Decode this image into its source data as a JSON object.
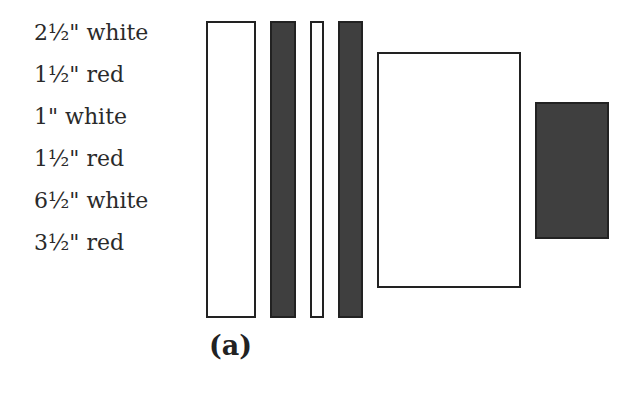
{
  "labels": [
    {
      "text": "2½\" white",
      "top": 0
    },
    {
      "text": "1½\" red",
      "top": 42
    },
    {
      "text": "1\" white",
      "top": 84
    },
    {
      "text": "1½\" red",
      "top": 126
    },
    {
      "text": "6½\" white",
      "top": 168
    },
    {
      "text": "3½\" red",
      "top": 210
    }
  ],
  "pieces": [
    {
      "name": "strip-2-5-white",
      "color": "white",
      "x": 206,
      "y": 21,
      "w": 50,
      "h": 297
    },
    {
      "name": "strip-1-5-red",
      "color": "red",
      "x": 270,
      "y": 21,
      "w": 26,
      "h": 297
    },
    {
      "name": "strip-1-white",
      "color": "white",
      "x": 310,
      "y": 21,
      "w": 14,
      "h": 297
    },
    {
      "name": "strip-1-5-red-2",
      "color": "red",
      "x": 338,
      "y": 21,
      "w": 25,
      "h": 297
    },
    {
      "name": "square-6-5-white",
      "color": "white",
      "x": 377,
      "y": 52,
      "w": 144,
      "h": 236
    },
    {
      "name": "square-3-5-red",
      "color": "red",
      "x": 535,
      "y": 102,
      "w": 74,
      "h": 137
    }
  ],
  "colors": {
    "white_piece": "#ffffff",
    "red_piece": "#3f3f3f",
    "outline": "#222222"
  },
  "caption": "(a)"
}
